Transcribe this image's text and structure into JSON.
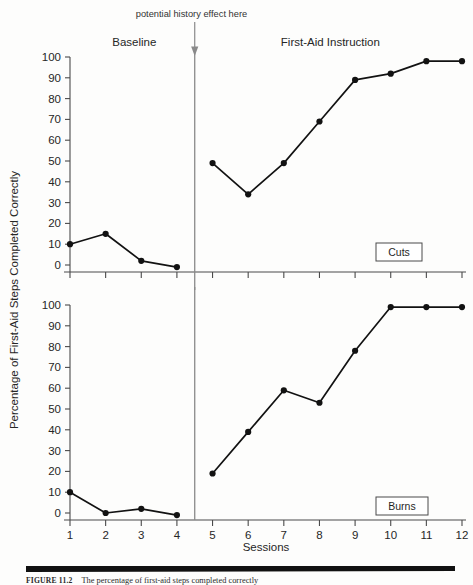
{
  "figure": {
    "caption_label": "FIGURE 11.2",
    "caption_text": "The percentage of first-aid steps completed correctly",
    "y_axis_title": "Percentage of First-Aid Steps Completed Correctly",
    "x_axis_title": "Sessions",
    "annotation": "potential history effect here",
    "phase_labels": {
      "baseline": "Baseline",
      "intervention": "First-Aid Instruction"
    },
    "panel_tags": {
      "top": "Cuts",
      "bottom": "Burns"
    },
    "colors": {
      "line": "#121212",
      "marker": "#121212",
      "axis": "#4a4a4a",
      "phase_line": "#8a8a8a",
      "background": "#fdfdfc"
    }
  },
  "chart_data": [
    {
      "type": "line",
      "title": "Cuts",
      "panel": "top",
      "xlabel": "Sessions",
      "ylabel": "Percentage of First-Aid Steps Completed Correctly",
      "xlim": [
        1,
        12
      ],
      "ylim": [
        0,
        100
      ],
      "yticks": [
        0,
        10,
        20,
        30,
        40,
        50,
        60,
        70,
        80,
        90,
        100
      ],
      "xticks": [
        1,
        2,
        3,
        4,
        5,
        6,
        7,
        8,
        9,
        10,
        11,
        12
      ],
      "grid": false,
      "legend": "none",
      "phase_change_x": 4.5,
      "annotations": [
        "potential history effect here"
      ],
      "series": [
        {
          "name": "Baseline",
          "x": [
            1,
            2,
            3,
            4
          ],
          "values": [
            10,
            15,
            2,
            -1
          ]
        },
        {
          "name": "First-Aid Instruction",
          "x": [
            5,
            6,
            7,
            8,
            9,
            10,
            11,
            12
          ],
          "values": [
            49,
            34,
            49,
            69,
            89,
            92,
            98,
            98
          ]
        }
      ]
    },
    {
      "type": "line",
      "title": "Burns",
      "panel": "bottom",
      "xlabel": "Sessions",
      "ylabel": "Percentage of First-Aid Steps Completed Correctly",
      "xlim": [
        1,
        12
      ],
      "ylim": [
        0,
        100
      ],
      "yticks": [
        0,
        10,
        20,
        30,
        40,
        50,
        60,
        70,
        80,
        90,
        100
      ],
      "xticks": [
        1,
        2,
        3,
        4,
        5,
        6,
        7,
        8,
        9,
        10,
        11,
        12
      ],
      "grid": false,
      "legend": "none",
      "phase_change_x": 4.5,
      "series": [
        {
          "name": "Baseline",
          "x": [
            1,
            2,
            3,
            4
          ],
          "values": [
            10,
            0,
            2,
            -1
          ]
        },
        {
          "name": "First-Aid Instruction",
          "x": [
            5,
            6,
            7,
            8,
            9,
            10,
            11,
            12
          ],
          "values": [
            19,
            39,
            59,
            53,
            78,
            99,
            99,
            99
          ]
        }
      ]
    }
  ],
  "y_tick_labels": [
    "100",
    "90",
    "80",
    "70",
    "60",
    "50",
    "40",
    "30",
    "20",
    "10",
    "0"
  ],
  "x_tick_labels": [
    "1",
    "2",
    "3",
    "4",
    "5",
    "6",
    "7",
    "8",
    "9",
    "10",
    "11",
    "12"
  ]
}
